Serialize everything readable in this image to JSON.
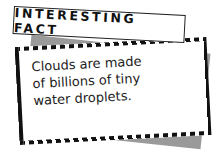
{
  "banner": {
    "title": "INTERESTING FACT"
  },
  "fact": {
    "lines": [
      "Clouds are made",
      "of billions of tiny",
      "water droplets."
    ]
  },
  "colors": {
    "border": "#111111",
    "shadow": "#9a9a9a",
    "background": "#ffffff"
  }
}
